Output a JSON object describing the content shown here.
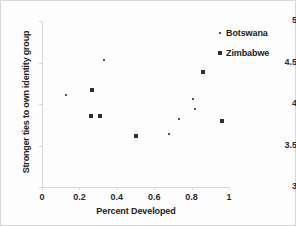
{
  "chart_data": {
    "type": "scatter",
    "title": "",
    "xlabel": "Percent Developed",
    "ylabel": "Stronger ties to own identity group",
    "xlim": [
      0,
      1
    ],
    "ylim": [
      3,
      5
    ],
    "grid": false,
    "legend_position": "top-right",
    "xticks": [
      "0",
      "0.2",
      "0.4",
      "0.6",
      "0.8",
      "1"
    ],
    "xtick_values": [
      0,
      0.2,
      0.4,
      0.6,
      0.8,
      1
    ],
    "yticks": [
      "3",
      "3.5",
      "4",
      "4.5",
      "5"
    ],
    "ytick_values": [
      3,
      3.5,
      4,
      4.5,
      5
    ],
    "series": [
      {
        "name": "Botswana",
        "marker": "small-dot",
        "color": "#555555",
        "points": [
          {
            "x": 0.13,
            "y": 4.11
          },
          {
            "x": 0.33,
            "y": 4.53
          },
          {
            "x": 0.68,
            "y": 3.64
          },
          {
            "x": 0.73,
            "y": 3.82
          },
          {
            "x": 0.81,
            "y": 4.06
          },
          {
            "x": 0.82,
            "y": 3.94
          }
        ]
      },
      {
        "name": "Zimbabwe",
        "marker": "square",
        "color": "#2e2e2e",
        "points": [
          {
            "x": 0.26,
            "y": 3.85
          },
          {
            "x": 0.27,
            "y": 4.17
          },
          {
            "x": 0.31,
            "y": 3.86
          },
          {
            "x": 0.5,
            "y": 3.61
          },
          {
            "x": 0.86,
            "y": 4.39
          },
          {
            "x": 0.96,
            "y": 3.8
          }
        ]
      }
    ]
  },
  "legend": {
    "items": [
      {
        "label": "Botswana",
        "marker": "small-dot"
      },
      {
        "label": "Zimbabwe",
        "marker": "square"
      }
    ]
  }
}
